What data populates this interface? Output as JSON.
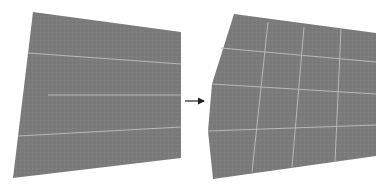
{
  "diagram": {
    "colors": {
      "background": "#ffffff",
      "surface": "#7b7b7b",
      "grid_line": "#b8b8b8",
      "arrow": "#222222"
    },
    "left_panel": {
      "name": "source-quad",
      "outline": [
        [
          33,
          12
        ],
        [
          181,
          32
        ],
        [
          181,
          158
        ],
        [
          13,
          178
        ]
      ],
      "horizontal_lines": [
        [
          [
            28,
            53
          ],
          [
            181,
            64
          ]
        ],
        [
          [
            48,
            95
          ],
          [
            181,
            95
          ]
        ],
        [
          [
            18,
            136
          ],
          [
            181,
            127
          ]
        ]
      ],
      "vertical_lines": []
    },
    "arrow": {
      "from": [
        185,
        101
      ],
      "to": [
        204,
        101
      ]
    },
    "right_panel": {
      "name": "warped-grid",
      "outline": [
        [
          234,
          14
        ],
        [
          376,
          33
        ],
        [
          376,
          156
        ],
        [
          213,
          179
        ],
        [
          208,
          131
        ],
        [
          212,
          84
        ]
      ],
      "horizontal_lines": [
        [
          [
            221,
            48
          ],
          [
            376,
            62
          ]
        ],
        [
          [
            212,
            84
          ],
          [
            376,
            94
          ]
        ],
        [
          [
            208,
            131
          ],
          [
            376,
            125
          ]
        ]
      ],
      "vertical_lines": [
        [
          [
            268,
            22
          ],
          [
            252,
            172
          ]
        ],
        [
          [
            304,
            27
          ],
          [
            292,
            167
          ]
        ],
        [
          [
            341,
            29
          ],
          [
            335,
            162
          ]
        ]
      ]
    }
  }
}
